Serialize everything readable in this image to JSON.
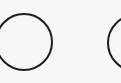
{
  "canvas": {
    "background": "#f7f7f6"
  },
  "shapes": [
    {
      "name": "circle-left",
      "cx": 24,
      "cy": 42,
      "r": 29,
      "stroke": "#1e1e1e",
      "stroke_width": 2
    },
    {
      "name": "circle-right",
      "cx": 136,
      "cy": 43,
      "r": 29,
      "stroke": "#1e1e1e",
      "stroke_width": 2
    }
  ]
}
